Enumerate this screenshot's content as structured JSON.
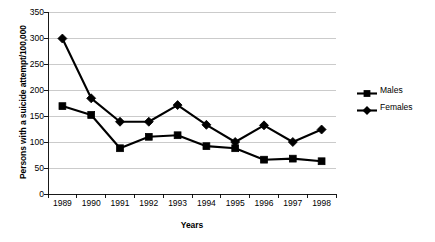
{
  "chart_data": {
    "type": "line",
    "title": "",
    "xlabel": "Years",
    "ylabel": "Persons with a suicide attempt/100,000",
    "categories": [
      "1989",
      "1990",
      "1991",
      "1992",
      "1993",
      "1994",
      "1995",
      "1996",
      "1997",
      "1998"
    ],
    "ylim": [
      0,
      350
    ],
    "yticks": [
      0,
      50,
      100,
      150,
      200,
      250,
      300,
      350
    ],
    "ytick_labels": [
      "0",
      "50",
      "100",
      "150",
      "200",
      "250",
      "300",
      "350"
    ],
    "grid": "horizontal",
    "legend_position": "right",
    "series": [
      {
        "name": "Males",
        "marker": "square",
        "color": "#000000",
        "values": [
          169,
          152,
          88,
          110,
          113,
          92,
          88,
          66,
          68,
          63
        ]
      },
      {
        "name": "Females",
        "marker": "diamond",
        "color": "#000000",
        "values": [
          299,
          184,
          139,
          139,
          171,
          133,
          100,
          132,
          100,
          124
        ]
      }
    ]
  },
  "legend": {
    "items": [
      {
        "label": "Males",
        "marker": "square-marker-icon"
      },
      {
        "label": "Females",
        "marker": "diamond-marker-icon"
      }
    ]
  },
  "axes": {
    "x_title": "Years",
    "y_title": "Persons with a suicide attempt/100,000"
  }
}
